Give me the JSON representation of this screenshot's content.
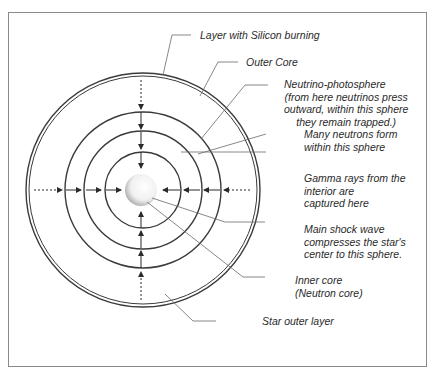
{
  "diagram": {
    "type": "concentric-star-core",
    "labels": [
      {
        "id": "silicon",
        "lines": [
          "Layer with Silicon burning"
        ]
      },
      {
        "id": "outer_core",
        "lines": [
          "Outer Core"
        ]
      },
      {
        "id": "neutrino",
        "lines": [
          "Neutrino-photosphere",
          "(from here neutrinos press",
          "outward, within this sphere",
          "they remain trapped.)"
        ]
      },
      {
        "id": "neutrons",
        "lines": [
          "Many neutrons form",
          "within this sphere"
        ]
      },
      {
        "id": "gamma",
        "lines": [
          "Gamma rays from the",
          "interior are",
          "captured here"
        ]
      },
      {
        "id": "shock",
        "lines": [
          "Main shock wave",
          "compresses the star's",
          "center to this sphere."
        ]
      },
      {
        "id": "inner_core",
        "lines": [
          "Inner core",
          "(Neutron core)"
        ]
      },
      {
        "id": "outer_layer",
        "lines": [
          "Star outer layer"
        ]
      }
    ],
    "colors": {
      "line": "#3a3a3a",
      "frame": "#8a8a8a",
      "leader": "#6a6a6a"
    }
  }
}
